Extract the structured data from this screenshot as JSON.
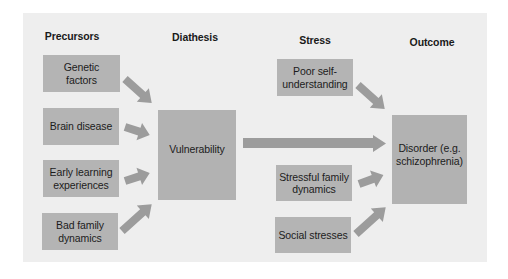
{
  "headings": {
    "precursors": "Precursors",
    "diathesis": "Diathesis",
    "stress": "Stress",
    "outcome": "Outcome"
  },
  "precursors": [
    {
      "label": "Genetic factors"
    },
    {
      "label": "Brain disease"
    },
    {
      "label": "Early learning experiences"
    },
    {
      "label": "Bad family dynamics"
    }
  ],
  "diathesis": {
    "label": "Vulnerability"
  },
  "stress": [
    {
      "label": "Poor self-understanding"
    },
    {
      "label": "Stressful family dynamics"
    },
    {
      "label": "Social stresses"
    }
  ],
  "outcome": {
    "label": "Disorder (e.g. schizophrenia)"
  },
  "colors": {
    "panel": "#eeeeee",
    "box": "#b4b4b4",
    "arrow": "#9c9c9c",
    "text": "#1c1c1c"
  }
}
